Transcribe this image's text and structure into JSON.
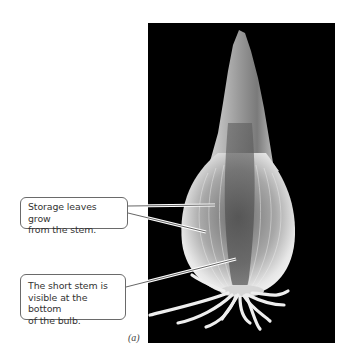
{
  "figure": {
    "panel_label": "(a)",
    "photo_subject": "onion bulb (longitudinal view) on black background",
    "callouts": [
      {
        "text": "Storage leaves grow from the stem.",
        "lines": [
          "Storage leaves grow",
          "from the stem."
        ]
      },
      {
        "text": "The short stem is visible at the bottom of the bulb.",
        "lines": [
          "The short stem is",
          "visible at the bottom",
          "of the bulb."
        ]
      }
    ]
  },
  "colors": {
    "background": "#ffffff",
    "photo_background": "#000000",
    "callout_border": "#6a6a6a",
    "callout_text": "#333333"
  }
}
